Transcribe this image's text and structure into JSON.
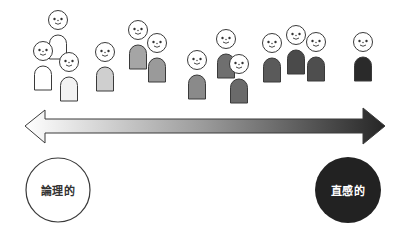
{
  "diagram": {
    "title": "",
    "scale": {
      "left_label": "論理的",
      "right_label": "直感的",
      "left_color": "#ffffff",
      "right_color": "#2a2a2a",
      "arrow": "double-headed gradient arrow from white (left) to black (right)"
    },
    "people": [
      {
        "id": 1,
        "head": [
          58,
          20
        ],
        "body_color": "#ffffff"
      },
      {
        "id": 2,
        "head": [
          43,
          51
        ],
        "body_color": "#ffffff"
      },
      {
        "id": 3,
        "head": [
          69,
          62
        ],
        "body_color": "#f2f2f2"
      },
      {
        "id": 4,
        "head": [
          105,
          52
        ],
        "body_color": "#cfcfcf"
      },
      {
        "id": 5,
        "head": [
          138,
          30
        ],
        "body_color": "#a5a5a5"
      },
      {
        "id": 6,
        "head": [
          157,
          43
        ],
        "body_color": "#9a9a9a"
      },
      {
        "id": 7,
        "head": [
          197,
          60
        ],
        "body_color": "#8a8a8a"
      },
      {
        "id": 8,
        "head": [
          226,
          39
        ],
        "body_color": "#6f6f6f"
      },
      {
        "id": 9,
        "head": [
          239,
          64
        ],
        "body_color": "#6a6a6a"
      },
      {
        "id": 10,
        "head": [
          272,
          43
        ],
        "body_color": "#5a5a5a"
      },
      {
        "id": 11,
        "head": [
          296,
          35
        ],
        "body_color": "#4a4a4a"
      },
      {
        "id": 12,
        "head": [
          316,
          42
        ],
        "body_color": "#4e4e4e"
      },
      {
        "id": 13,
        "head": [
          363,
          42
        ],
        "body_color": "#2a2a2a"
      }
    ]
  }
}
